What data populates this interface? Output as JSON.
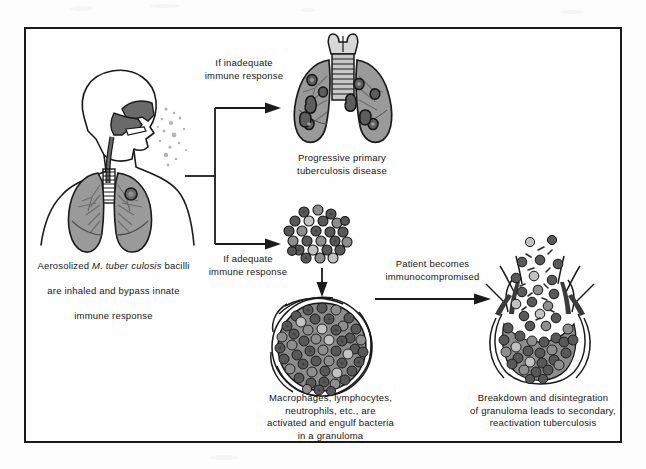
{
  "figure": {
    "title_present": false,
    "frame": {
      "border_color": "#1a1a1a"
    },
    "palette": {
      "outline": "#1a1a1a",
      "lung_fill": "#9a9a9a",
      "lung_shade": "#7d7d7d",
      "airway_dark": "#6a6a6a",
      "cell_dark": "#4f4f4f",
      "cell_mid": "#8d8d8d",
      "cell_light": "#c9c9c9",
      "paper": "#fefefe",
      "text": "#171717"
    }
  },
  "nodes": {
    "body": {
      "name": "human-torso-with-lungs",
      "caption_line1_pre": "Aerosolized ",
      "caption_species": "M. tuber culosis",
      "caption_line1_post": " bacilli",
      "caption_line2": "are inhaled and bypass innate",
      "caption_line3": "immune response"
    },
    "diseased_lungs": {
      "name": "progressive-primary-tb-lungs",
      "caption": "Progressive primary\ntuberculosis disease",
      "lesion_count": 12
    },
    "cell_cluster": {
      "name": "immune-cell-cluster",
      "cell_count": 26
    },
    "granuloma": {
      "name": "intact-granuloma",
      "caption": "Macrophages, lymphocytes,\nneutrophils, etc., are\nactivated and engulf bacteria\nin a granuloma"
    },
    "ruptured_granuloma": {
      "name": "ruptured-granuloma",
      "caption": "Breakdown and disintegration\nof granuloma leads to secondary,\nreactivation tuberculosis"
    }
  },
  "edges": {
    "branch_top": {
      "label": "If inadequate\nimmune response"
    },
    "branch_bottom": {
      "label": "If adequate\nimmune response"
    },
    "to_reactivation": {
      "label": "Patient becomes\nimmunocompromised"
    }
  }
}
